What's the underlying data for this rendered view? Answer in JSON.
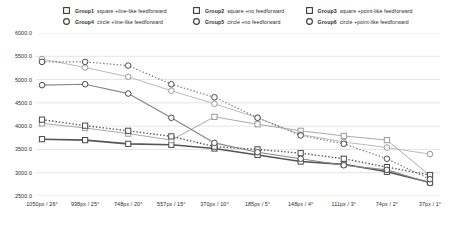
{
  "chart_data": {
    "type": "line",
    "title": "",
    "xlabel": "",
    "ylabel": "",
    "ylim": [
      2500.0,
      6000.0
    ],
    "ytick_step": 500.0,
    "grid": true,
    "legend_position": "top",
    "ytick_labels": [
      "6000.0",
      "5500.0",
      "5000.0",
      "4500.0",
      "4000.0",
      "3500.0",
      "3000.0",
      "2500.0"
    ],
    "ytick_values": [
      6000.0,
      5500.0,
      5000.0,
      4500.0,
      4000.0,
      3500.0,
      3000.0,
      2500.0
    ],
    "categories": [
      "1050px / 26°",
      "938px / 25°",
      "748px / 20°",
      "557px / 15°",
      "370px / 10°",
      "185px / 5°",
      "148px / 4°",
      "111px / 3°",
      "74px / 2°",
      "37px / 1°"
    ],
    "series": [
      {
        "name": "Group1",
        "label": "square +line-like feedforward",
        "marker": "square",
        "line": "solid",
        "color": "#555555",
        "width": 1.6,
        "values": [
          3720,
          3700,
          3620,
          3600,
          3520,
          3380,
          3240,
          3180,
          3020,
          2790
        ]
      },
      {
        "name": "Group2",
        "label": "square +no feedforward",
        "marker": "square",
        "line": "solid",
        "color": "#aaaaaa",
        "width": 1.0,
        "values": [
          4060,
          3960,
          3840,
          3700,
          4200,
          4040,
          3900,
          3790,
          3700,
          2940
        ]
      },
      {
        "name": "Group3",
        "label": "square +point-like feedforward",
        "marker": "square",
        "line": "dotted",
        "color": "#555555",
        "width": 1.4,
        "values": [
          4140,
          4010,
          3900,
          3780,
          3560,
          3500,
          3420,
          3300,
          3120,
          2950
        ]
      },
      {
        "name": "Group4",
        "label": "circle +line-like feedforward",
        "marker": "circle",
        "line": "solid",
        "color": "#888888",
        "width": 1.2,
        "values": [
          4880,
          4900,
          4700,
          4180,
          3640,
          3440,
          3300,
          3160,
          3060,
          2780
        ]
      },
      {
        "name": "Group5",
        "label": "circle +no feedforward",
        "marker": "circle",
        "line": "solid",
        "color": "#bbbbbb",
        "width": 1.0,
        "values": [
          5440,
          5260,
          5060,
          4760,
          4480,
          4180,
          3820,
          3660,
          3540,
          3400
        ]
      },
      {
        "name": "Group6",
        "label": "circle +point-like feedforward",
        "marker": "circle",
        "line": "dotted",
        "color": "#777777",
        "width": 1.2,
        "values": [
          5380,
          5380,
          5300,
          4900,
          4620,
          4180,
          3800,
          3620,
          3300,
          2860
        ]
      }
    ]
  }
}
